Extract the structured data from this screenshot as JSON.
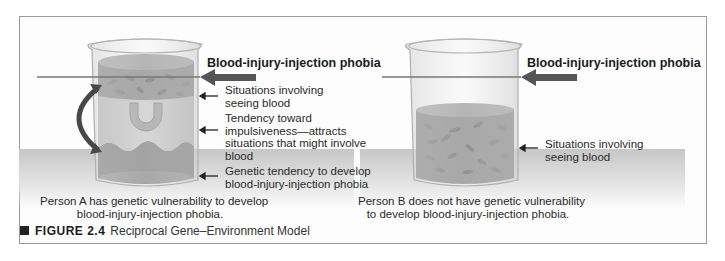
{
  "figure": {
    "number_label": "FIGURE 2.4",
    "title": "Reciprocal Gene–Environment Model"
  },
  "person_a": {
    "threshold_label": "Blood-injury-injection phobia",
    "layers": [
      {
        "label_line1": "Situations involving",
        "label_line2": "seeing blood"
      },
      {
        "label_line1": "Tendency toward",
        "label_line2": "impulsiveness—attracts",
        "label_line3": "situations that might involve",
        "label_line4": "blood"
      },
      {
        "label_line1": "Genetic tendency to develop",
        "label_line2": "blood-injury-injection phobia"
      }
    ],
    "caption_line1": "Person A has genetic vulnerability to develop",
    "caption_line2": "blood-injury-injection phobia."
  },
  "person_b": {
    "threshold_label": "Blood-injury-injection phobia",
    "layers": [
      {
        "label_line1": "Situations involving",
        "label_line2": "seeing blood"
      }
    ],
    "caption_line1": "Person B does not have genetic vulnerability",
    "caption_line2": "to develop blood-injury-injection phobia."
  },
  "colors": {
    "blood_layer": "#6a6a6a",
    "impulsive_layer": "#b3b3b3",
    "genetic_layer": "#5a5a5a",
    "arrow": "#4a4a4a",
    "ground": "#c7c7c7"
  }
}
